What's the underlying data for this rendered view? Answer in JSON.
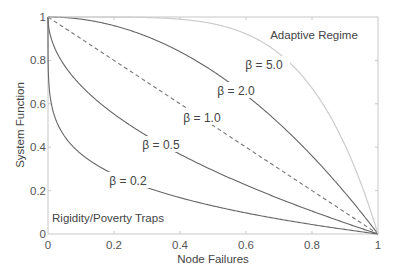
{
  "chart_data": {
    "type": "line",
    "title": "",
    "xlabel": "Node Failures",
    "ylabel": "System Function",
    "xlim": [
      0,
      1
    ],
    "ylim": [
      0,
      1
    ],
    "grid": false,
    "legend": "none (inline curve labels)",
    "xticks": [
      0,
      0.2,
      0.4,
      0.6,
      0.8,
      1
    ],
    "xtick_labels": [
      "0",
      "0.2",
      "0.4",
      "0.6",
      "0.8",
      "1"
    ],
    "yticks": [
      0,
      0.2,
      0.4,
      0.6,
      0.8,
      1
    ],
    "ytick_labels": [
      "0",
      "0.2",
      "0.4",
      "0.6",
      "0.8",
      "1"
    ],
    "formula": "y = 1 - x^beta",
    "x": [
      0,
      0.05,
      0.1,
      0.2,
      0.3,
      0.4,
      0.5,
      0.6,
      0.7,
      0.8,
      0.9,
      0.95,
      1
    ],
    "series": [
      {
        "name": "β = 0.2",
        "beta": 0.2,
        "style": "solid",
        "color": "#666666",
        "values": [
          1.0,
          0.451,
          0.369,
          0.275,
          0.214,
          0.167,
          0.129,
          0.097,
          0.069,
          0.044,
          0.021,
          0.01,
          0.0
        ]
      },
      {
        "name": "β = 0.5",
        "beta": 0.5,
        "style": "solid",
        "color": "#666666",
        "values": [
          1.0,
          0.776,
          0.684,
          0.553,
          0.452,
          0.368,
          0.293,
          0.225,
          0.163,
          0.106,
          0.051,
          0.025,
          0.0
        ]
      },
      {
        "name": "β = 1.0",
        "beta": 1.0,
        "style": "dashed",
        "color": "#777777",
        "values": [
          1.0,
          0.95,
          0.9,
          0.8,
          0.7,
          0.6,
          0.5,
          0.4,
          0.3,
          0.2,
          0.1,
          0.05,
          0.0
        ]
      },
      {
        "name": "β = 2.0",
        "beta": 2.0,
        "style": "solid",
        "color": "#666666",
        "values": [
          1.0,
          0.998,
          0.99,
          0.96,
          0.91,
          0.84,
          0.75,
          0.64,
          0.51,
          0.36,
          0.19,
          0.098,
          0.0
        ]
      },
      {
        "name": "β = 5.0",
        "beta": 5.0,
        "style": "solid",
        "color": "#cccccc",
        "values": [
          1.0,
          1.0,
          1.0,
          1.0,
          0.998,
          0.99,
          0.969,
          0.922,
          0.832,
          0.672,
          0.41,
          0.226,
          0.0
        ]
      }
    ],
    "annotations": [
      {
        "text": "Adaptive Regime",
        "x": 0.81,
        "y": 0.92
      },
      {
        "text": "Rigidity/Poverty Traps",
        "x": 0.18,
        "y": 0.07
      }
    ]
  },
  "labels": {
    "xlabel": "Node Failures",
    "ylabel": "System Function",
    "adaptive": "Adaptive Regime",
    "rigidity": "Rigidity/Poverty Traps",
    "beta_02": "β = 0.2",
    "beta_05": "β = 0.5",
    "beta_10": "β = 1.0",
    "beta_20": "β = 2.0",
    "beta_50": "β = 5.0",
    "xt0": "0",
    "xt1": "0.2",
    "xt2": "0.4",
    "xt3": "0.6",
    "xt4": "0.8",
    "xt5": "1",
    "yt0": "0",
    "yt1": "0.2",
    "yt2": "0.4",
    "yt3": "0.6",
    "yt4": "0.8",
    "yt5": "1"
  }
}
